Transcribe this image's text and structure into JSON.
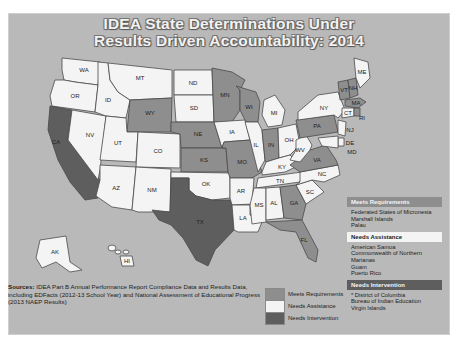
{
  "title": {
    "line1": "IDEA State Determinations Under",
    "line2": "Results Driven Accountability: 2014"
  },
  "colors": {
    "background": "#b9b9b9",
    "meets_requirements": "#8e8e8e",
    "needs_assistance": "#f4f4f4",
    "needs_intervention": "#5e5e5e"
  },
  "states": [
    {
      "abbr": "WA",
      "status": "needs_assistance"
    },
    {
      "abbr": "OR",
      "status": "needs_assistance"
    },
    {
      "abbr": "CA",
      "status": "needs_intervention"
    },
    {
      "abbr": "NV",
      "status": "needs_assistance"
    },
    {
      "abbr": "ID",
      "status": "needs_assistance"
    },
    {
      "abbr": "MT",
      "status": "needs_assistance"
    },
    {
      "abbr": "WY",
      "status": "meets_requirements"
    },
    {
      "abbr": "UT",
      "status": "needs_assistance"
    },
    {
      "abbr": "CO",
      "status": "needs_assistance"
    },
    {
      "abbr": "AZ",
      "status": "needs_assistance"
    },
    {
      "abbr": "NM",
      "status": "needs_assistance"
    },
    {
      "abbr": "ND",
      "status": "needs_assistance"
    },
    {
      "abbr": "SD",
      "status": "needs_assistance"
    },
    {
      "abbr": "NE",
      "status": "meets_requirements"
    },
    {
      "abbr": "KS",
      "status": "meets_requirements"
    },
    {
      "abbr": "OK",
      "status": "needs_assistance"
    },
    {
      "abbr": "TX",
      "status": "needs_intervention"
    },
    {
      "abbr": "MN",
      "status": "meets_requirements"
    },
    {
      "abbr": "IA",
      "status": "needs_assistance"
    },
    {
      "abbr": "MO",
      "status": "meets_requirements"
    },
    {
      "abbr": "AR",
      "status": "needs_assistance"
    },
    {
      "abbr": "LA",
      "status": "needs_assistance"
    },
    {
      "abbr": "WI",
      "status": "meets_requirements"
    },
    {
      "abbr": "IL",
      "status": "needs_assistance"
    },
    {
      "abbr": "MI",
      "status": "needs_assistance"
    },
    {
      "abbr": "IN",
      "status": "meets_requirements"
    },
    {
      "abbr": "OH",
      "status": "needs_assistance"
    },
    {
      "abbr": "KY",
      "status": "needs_assistance"
    },
    {
      "abbr": "TN",
      "status": "needs_assistance"
    },
    {
      "abbr": "MS",
      "status": "needs_assistance"
    },
    {
      "abbr": "AL",
      "status": "needs_assistance"
    },
    {
      "abbr": "GA",
      "status": "meets_requirements"
    },
    {
      "abbr": "FL",
      "status": "meets_requirements"
    },
    {
      "abbr": "SC",
      "status": "needs_assistance"
    },
    {
      "abbr": "NC",
      "status": "needs_assistance"
    },
    {
      "abbr": "VA",
      "status": "meets_requirements"
    },
    {
      "abbr": "WV",
      "status": "needs_assistance"
    },
    {
      "abbr": "PA",
      "status": "meets_requirements"
    },
    {
      "abbr": "NY",
      "status": "needs_assistance"
    },
    {
      "abbr": "VT",
      "status": "meets_requirements"
    },
    {
      "abbr": "NH",
      "status": "meets_requirements"
    },
    {
      "abbr": "ME",
      "status": "needs_assistance"
    },
    {
      "abbr": "MA",
      "status": "meets_requirements"
    },
    {
      "abbr": "CT",
      "status": "needs_assistance"
    },
    {
      "abbr": "RI",
      "status": "meets_requirements"
    },
    {
      "abbr": "NJ",
      "status": "needs_assistance"
    },
    {
      "abbr": "DE",
      "status": "needs_assistance"
    },
    {
      "abbr": "MD",
      "status": "needs_assistance"
    },
    {
      "abbr": "AK",
      "status": "needs_assistance"
    },
    {
      "abbr": "HI",
      "status": "needs_assistance"
    }
  ],
  "sources": {
    "label": "Sources:",
    "text": "IDEA Part B Annual Performance Report Compliance Data and Results Data, including EDFacts (2012-13 School Year) and National Assessment of Educational Progress (2013 NAEP Results)"
  },
  "legend": [
    {
      "label": "Meets Requirements",
      "status": "meets_requirements"
    },
    {
      "label": "Needs Assistance",
      "status": "needs_assistance"
    },
    {
      "label": "Needs Intervention",
      "status": "needs_intervention"
    }
  ],
  "territories": [
    {
      "heading": "Meets Requirements",
      "status": "meets_requirements",
      "items": [
        "Federated States of Micronesia",
        "Marshall Islands",
        "Palau"
      ]
    },
    {
      "heading": "Needs Assistance",
      "status": "needs_assistance",
      "items": [
        "American Samoa",
        "Commonwealth of Northern Marianas",
        "Guam",
        "Puerto Rico"
      ]
    },
    {
      "heading": "Needs Intervention",
      "status": "needs_intervention",
      "items": [
        "* District of Columbia",
        "Bureau of Indian Education",
        "Virgin Islands"
      ]
    }
  ]
}
